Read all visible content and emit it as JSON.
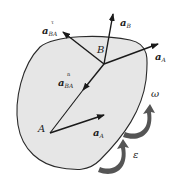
{
  "diagram": {
    "type": "rigid-body-acceleration",
    "body": {
      "fill": "#e6e6e6",
      "stroke": "#2a2a2a"
    },
    "points": {
      "A": {
        "label": "A"
      },
      "B": {
        "label": "B"
      }
    },
    "vectors": {
      "a_B": {
        "base": "a",
        "sub": "B",
        "sup": ""
      },
      "a_A_at_B": {
        "base": "a",
        "sub": "A",
        "sup": ""
      },
      "a_BA_tau": {
        "base": "a",
        "sub": "BA",
        "sup": "τ"
      },
      "a_BA_n": {
        "base": "a",
        "sub": "BA",
        "sup": "n"
      },
      "a_A_at_A": {
        "base": "a",
        "sub": "A",
        "sup": ""
      }
    },
    "rotation": {
      "omega": {
        "label": "ω"
      },
      "epsilon": {
        "label": "ε"
      },
      "arrow_color": "#555555"
    }
  }
}
